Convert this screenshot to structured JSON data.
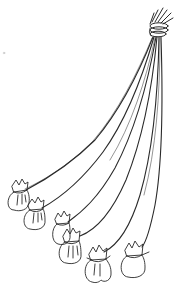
{
  "illustration": {
    "subject": "six cloth bundles tied to strings gathered at a top knot",
    "style": "black ink line drawing on white",
    "colors": {
      "background": "#ffffff",
      "ink": "#2a2a2a"
    },
    "knot": {
      "x": 160,
      "y": 24
    },
    "bundles": [
      {
        "id": 1,
        "x": 17,
        "y": 200
      },
      {
        "id": 2,
        "x": 35,
        "y": 218
      },
      {
        "id": 3,
        "x": 63,
        "y": 228
      },
      {
        "id": 4,
        "x": 71,
        "y": 248
      },
      {
        "id": 5,
        "x": 98,
        "y": 265
      },
      {
        "id": 6,
        "x": 136,
        "y": 260
      }
    ]
  }
}
